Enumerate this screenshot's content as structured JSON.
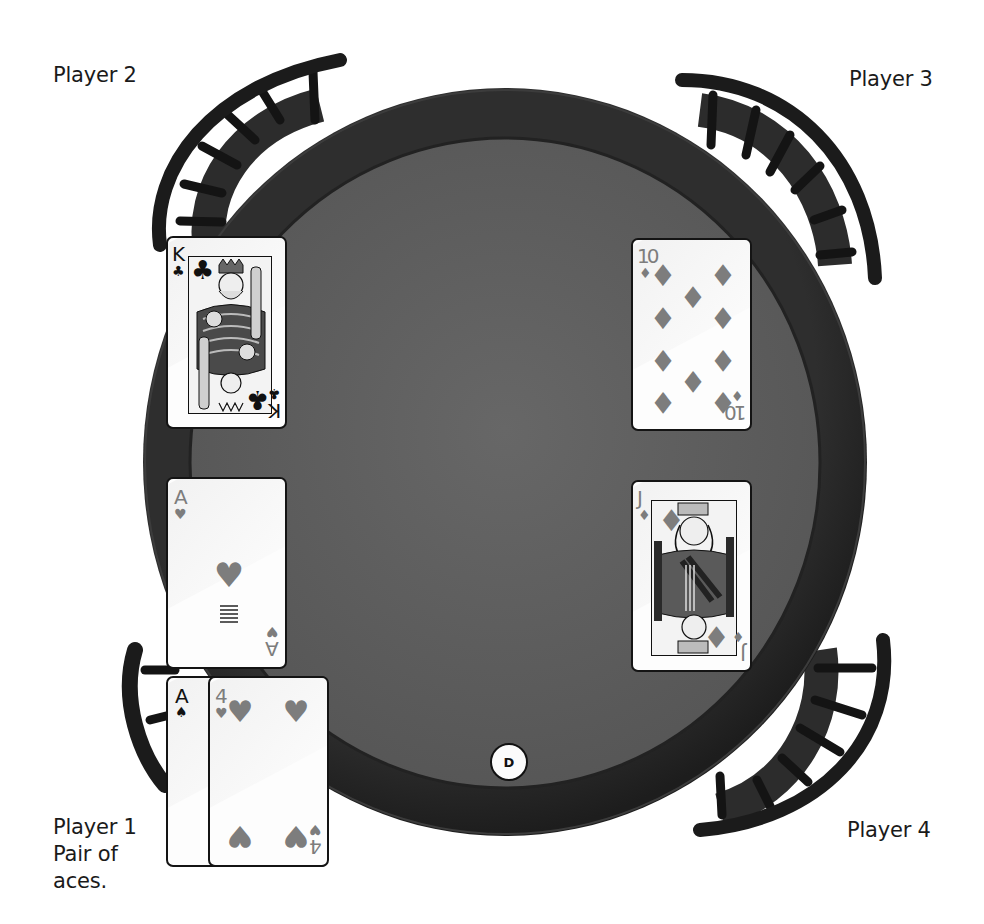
{
  "game": {
    "type": "poker-table",
    "dealer_button": {
      "label": "D",
      "seat": "bottom-center"
    }
  },
  "players": [
    {
      "id": 1,
      "name": "Player 1",
      "hand_description": "Pair of aces.",
      "position": "bottom-left",
      "cards": [
        {
          "rank": "A",
          "suit": "spades",
          "suit_glyph": "♠",
          "color": "black"
        },
        {
          "rank": "4",
          "suit": "hearts",
          "suit_glyph": "♥",
          "color": "red"
        }
      ]
    },
    {
      "id": 2,
      "name": "Player 2",
      "position": "top-left",
      "cards": [
        {
          "rank": "K",
          "suit": "clubs",
          "suit_glyph": "♣",
          "color": "black"
        },
        {
          "rank": "A",
          "suit": "hearts",
          "suit_glyph": "♥",
          "color": "red"
        }
      ]
    },
    {
      "id": 3,
      "name": "Player 3",
      "position": "top-right",
      "cards": [
        {
          "rank": "10",
          "suit": "diamonds",
          "suit_glyph": "♦",
          "color": "red"
        },
        {
          "rank": "J",
          "suit": "diamonds",
          "suit_glyph": "♦",
          "color": "red"
        }
      ]
    },
    {
      "id": 4,
      "name": "Player 4",
      "position": "bottom-right",
      "cards": []
    }
  ],
  "labels": {
    "p1_name": "Player 1",
    "p1_hand_line1": "Pair of",
    "p1_hand_line2": "aces.",
    "p2_name": "Player 2",
    "p3_name": "Player 3",
    "p4_name": "Player 4"
  },
  "cards": {
    "k_clubs": {
      "rank": "K",
      "suit": "♣"
    },
    "ten_diamonds": {
      "rank": "10",
      "suit": "♦"
    },
    "a_hearts": {
      "rank": "A",
      "suit": "♥"
    },
    "j_diamonds": {
      "rank": "J",
      "suit": "♦"
    },
    "a_spades": {
      "rank": "A",
      "suit": "♠"
    },
    "four_hearts": {
      "rank": "4",
      "suit": "♥"
    }
  },
  "colors": {
    "felt": "#5e5e5e",
    "rail": "#2a2a2a",
    "chair": "#1b1b1b",
    "red_suit": "#7d7d7d",
    "black_suit": "#111111",
    "text": "#1a1a1a"
  }
}
